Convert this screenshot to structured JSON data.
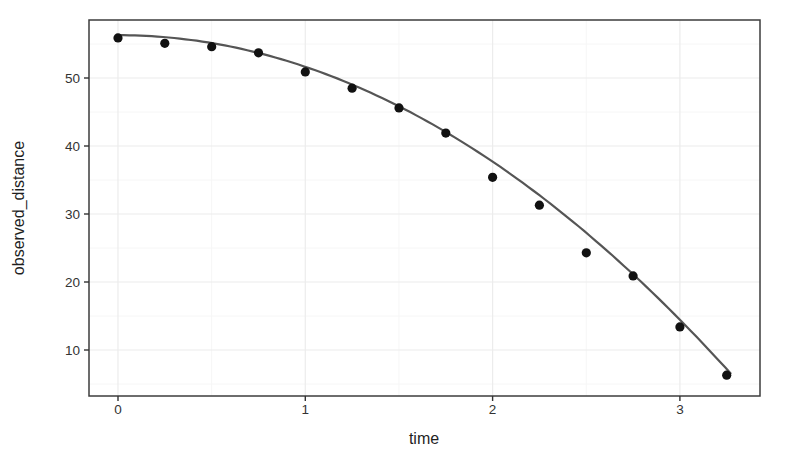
{
  "figure": {
    "background": "#ffffff",
    "width": 796,
    "height": 457
  },
  "chart_data": {
    "type": "scatter",
    "title": "",
    "xlabel": "time",
    "ylabel": "observed_distance",
    "x_ticks": [
      "0",
      "1",
      "2",
      "3"
    ],
    "x_tick_values": [
      0,
      1,
      2,
      3
    ],
    "y_ticks": [
      "10",
      "20",
      "30",
      "40",
      "50"
    ],
    "y_tick_values": [
      10,
      20,
      30,
      40,
      50
    ],
    "x_minor_ticks": [
      0.5,
      1.5,
      2.5
    ],
    "y_minor_ticks": [
      5,
      15,
      25,
      35,
      45,
      55
    ],
    "xlim": [
      -0.15,
      3.43
    ],
    "ylim": [
      3.2,
      58.5
    ],
    "grid": "major and minor gridlines, very light gray, panel border on",
    "legend": "none",
    "points": {
      "x": [
        0,
        0.25,
        0.5,
        0.75,
        1.0,
        1.25,
        1.5,
        1.75,
        2.0,
        2.25,
        2.5,
        2.75,
        3.0,
        3.25
      ],
      "y": [
        55.9,
        55.1,
        54.6,
        53.7,
        50.9,
        48.5,
        45.6,
        41.9,
        35.4,
        31.3,
        24.3,
        20.9,
        13.4,
        6.3
      ]
    },
    "fit_curve": {
      "model": "quadratic",
      "formula": "d(t) = 56.3 - 4.65*t^2",
      "a": 56.3,
      "b": 0,
      "c": -4.65,
      "t_range": [
        0,
        3.27
      ]
    },
    "colors": {
      "point": "#111111",
      "curve": "#555555",
      "grid_major": "#ececec",
      "grid_minor": "#f6f6f6",
      "panel_border": "#3c3c3c",
      "tick_mark": "#333333",
      "tick_label": "#333333",
      "axis_label": "#1f1f1f"
    }
  }
}
